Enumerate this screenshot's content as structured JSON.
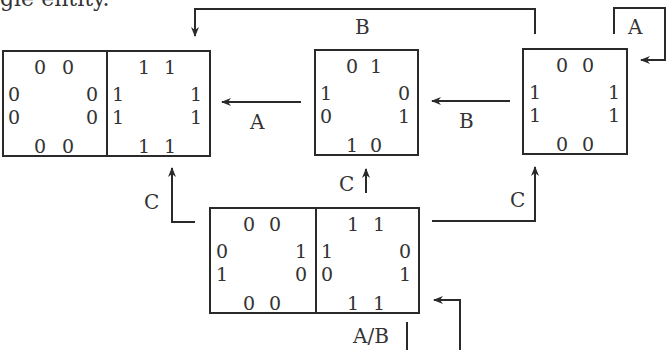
{
  "caption": "gle entity.",
  "colors": {
    "line": "#2a2a2a",
    "text": "#333333",
    "background": "#ffffff"
  },
  "labels": {
    "top_B": "B",
    "self_A": "A",
    "arrow_A": "A",
    "arrow_B": "B",
    "c_left": "C",
    "c_mid": "C",
    "c_right": "C",
    "ab": "A/B"
  },
  "boxes": {
    "box1": {
      "cells": [
        {
          "top": [
            "0",
            "0"
          ],
          "left": [
            "0",
            "0"
          ],
          "right": [
            "0",
            "0"
          ],
          "bottom": [
            "0",
            "0"
          ]
        },
        {
          "top": [
            "1",
            "1"
          ],
          "left": [
            "1",
            "1"
          ],
          "right": [
            "1",
            "1"
          ],
          "bottom": [
            "1",
            "1"
          ]
        }
      ]
    },
    "box2": {
      "cells": [
        {
          "top": [
            "0",
            "1"
          ],
          "left": [
            "1",
            "0"
          ],
          "right": [
            "0",
            "1"
          ],
          "bottom": [
            "1",
            "0"
          ]
        }
      ]
    },
    "box3": {
      "cells": [
        {
          "top": [
            "0",
            "0"
          ],
          "left": [
            "1",
            "1"
          ],
          "right": [
            "1",
            "1"
          ],
          "bottom": [
            "0",
            "0"
          ]
        }
      ]
    },
    "box4": {
      "cells": [
        {
          "top": [
            "0",
            "0"
          ],
          "left": [
            "0",
            "1"
          ],
          "right": [
            "1",
            "0"
          ],
          "bottom": [
            "0",
            "0"
          ]
        },
        {
          "top": [
            "1",
            "1"
          ],
          "left": [
            "1",
            "0"
          ],
          "right": [
            "0",
            "1"
          ],
          "bottom": [
            "1",
            "1"
          ]
        }
      ]
    }
  }
}
